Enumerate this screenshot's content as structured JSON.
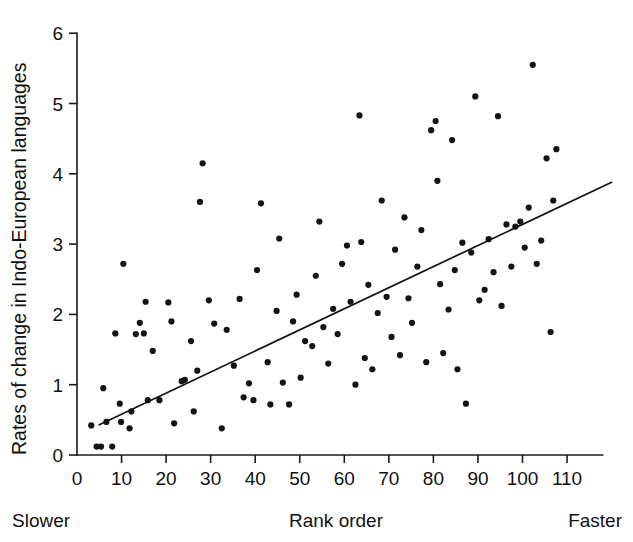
{
  "chart_data": {
    "type": "scatter",
    "title": "",
    "xlabel": "Rank order",
    "ylabel": "Rates of change in Indo-European languages",
    "xlim": [
      0,
      118
    ],
    "ylim": [
      0,
      6
    ],
    "xticks": [
      0,
      10,
      20,
      30,
      40,
      50,
      60,
      70,
      80,
      90,
      100,
      110
    ],
    "yticks": [
      0,
      1,
      2,
      3,
      4,
      5,
      6
    ],
    "grid": false,
    "legend": null,
    "annotations": {
      "x_axis_left_end": "Slower",
      "x_axis_right_end": "Faster"
    },
    "marker": {
      "shape": "circle",
      "radius": 3.1,
      "color": "#141414"
    },
    "fit_line": {
      "type": "linear-regression",
      "color": "#111111",
      "x_start": 5,
      "y_start": 0.43,
      "x_end": 120,
      "y_end": 3.88
    },
    "points": [
      [
        3.2,
        0.42
      ],
      [
        4.4,
        0.12
      ],
      [
        5.4,
        0.12
      ],
      [
        5.9,
        0.95
      ],
      [
        6.6,
        0.47
      ],
      [
        7.9,
        0.12
      ],
      [
        8.6,
        1.73
      ],
      [
        9.6,
        0.73
      ],
      [
        9.9,
        0.47
      ],
      [
        10.4,
        2.72
      ],
      [
        11.8,
        0.38
      ],
      [
        12.2,
        0.62
      ],
      [
        13.2,
        1.72
      ],
      [
        14.1,
        1.88
      ],
      [
        15.0,
        1.73
      ],
      [
        15.4,
        2.18
      ],
      [
        15.9,
        0.78
      ],
      [
        17.0,
        1.48
      ],
      [
        18.5,
        0.78
      ],
      [
        20.5,
        2.17
      ],
      [
        21.2,
        1.9
      ],
      [
        21.8,
        0.45
      ],
      [
        23.5,
        1.05
      ],
      [
        24.2,
        1.07
      ],
      [
        25.6,
        1.62
      ],
      [
        26.2,
        0.62
      ],
      [
        27.0,
        1.2
      ],
      [
        27.6,
        3.6
      ],
      [
        28.2,
        4.15
      ],
      [
        29.6,
        2.2
      ],
      [
        30.8,
        1.87
      ],
      [
        32.5,
        0.38
      ],
      [
        33.6,
        1.78
      ],
      [
        35.2,
        1.27
      ],
      [
        36.5,
        2.22
      ],
      [
        37.4,
        0.82
      ],
      [
        38.6,
        1.02
      ],
      [
        39.6,
        0.78
      ],
      [
        40.4,
        2.63
      ],
      [
        41.3,
        3.58
      ],
      [
        42.8,
        1.32
      ],
      [
        43.4,
        0.72
      ],
      [
        44.8,
        2.05
      ],
      [
        45.4,
        3.08
      ],
      [
        46.2,
        1.03
      ],
      [
        47.6,
        0.72
      ],
      [
        48.5,
        1.9
      ],
      [
        49.3,
        2.28
      ],
      [
        50.2,
        1.1
      ],
      [
        51.2,
        1.62
      ],
      [
        52.8,
        1.55
      ],
      [
        53.6,
        2.55
      ],
      [
        54.4,
        3.32
      ],
      [
        55.3,
        1.82
      ],
      [
        56.4,
        1.3
      ],
      [
        57.5,
        2.08
      ],
      [
        58.5,
        1.72
      ],
      [
        59.5,
        2.72
      ],
      [
        60.6,
        2.98
      ],
      [
        61.4,
        2.18
      ],
      [
        62.5,
        1.0
      ],
      [
        63.4,
        4.83
      ],
      [
        63.8,
        3.03
      ],
      [
        64.6,
        1.38
      ],
      [
        65.4,
        2.42
      ],
      [
        66.3,
        1.22
      ],
      [
        67.5,
        2.02
      ],
      [
        68.4,
        3.62
      ],
      [
        69.5,
        2.25
      ],
      [
        70.6,
        1.68
      ],
      [
        71.4,
        2.92
      ],
      [
        72.5,
        1.42
      ],
      [
        73.5,
        3.38
      ],
      [
        74.4,
        2.23
      ],
      [
        75.2,
        1.88
      ],
      [
        76.4,
        2.68
      ],
      [
        77.3,
        3.2
      ],
      [
        78.4,
        1.32
      ],
      [
        79.5,
        4.62
      ],
      [
        80.5,
        4.75
      ],
      [
        80.9,
        3.9
      ],
      [
        81.5,
        2.43
      ],
      [
        82.2,
        1.45
      ],
      [
        83.4,
        2.07
      ],
      [
        84.2,
        4.48
      ],
      [
        84.8,
        2.63
      ],
      [
        85.4,
        1.22
      ],
      [
        86.5,
        3.02
      ],
      [
        87.3,
        0.73
      ],
      [
        88.5,
        2.88
      ],
      [
        89.4,
        5.1
      ],
      [
        90.3,
        2.2
      ],
      [
        91.5,
        2.35
      ],
      [
        92.4,
        3.07
      ],
      [
        93.5,
        2.6
      ],
      [
        94.5,
        4.82
      ],
      [
        95.3,
        2.12
      ],
      [
        96.4,
        3.28
      ],
      [
        97.5,
        2.68
      ],
      [
        98.4,
        3.25
      ],
      [
        99.5,
        3.32
      ],
      [
        100.5,
        2.95
      ],
      [
        101.4,
        3.52
      ],
      [
        102.3,
        5.55
      ],
      [
        103.2,
        2.72
      ],
      [
        104.2,
        3.05
      ],
      [
        105.4,
        4.22
      ],
      [
        106.3,
        1.75
      ],
      [
        106.9,
        3.62
      ],
      [
        107.6,
        4.35
      ]
    ]
  }
}
